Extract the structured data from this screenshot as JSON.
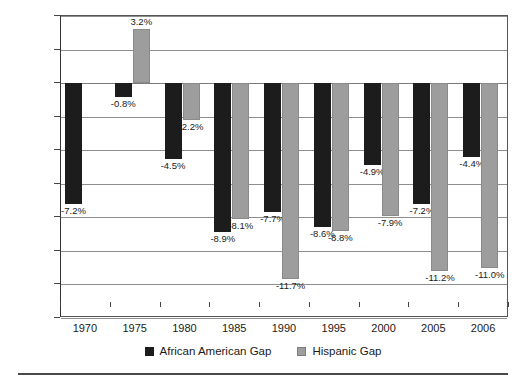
{
  "chart_data": {
    "type": "bar",
    "title": "",
    "subtitle": "",
    "xlabel": "",
    "ylabel": "",
    "categories": [
      "1970",
      "1975",
      "1980",
      "1985",
      "1990",
      "1995",
      "2000",
      "2005",
      "2006"
    ],
    "series": [
      {
        "name": "African American Gap",
        "color": "#1c1c1c",
        "values": [
          -7.2,
          -0.8,
          -4.5,
          -8.9,
          -7.7,
          -8.6,
          -4.9,
          -7.2,
          -4.4
        ],
        "labels": [
          "-7.2%",
          "-0.8%",
          "-4.5%",
          "-8.9%",
          "-7.7%",
          "-8.6%",
          "-4.9%",
          "-7.2%",
          "-4.4%"
        ]
      },
      {
        "name": "Hispanic Gap",
        "color": "#9d9d9d",
        "values": [
          null,
          3.2,
          -2.2,
          -8.1,
          -11.7,
          -8.8,
          -7.9,
          -11.2,
          -11.0
        ],
        "labels": [
          null,
          "3.2%",
          "-2.2%",
          "-8.1%",
          "-11.7%",
          "-8.8%",
          "-7.9%",
          "-11.2%",
          "-11.0%"
        ]
      }
    ],
    "ylim": [
      -14.0,
      4.0
    ],
    "ytick_values": [
      4.0,
      2.0,
      0.0,
      -2.0,
      -4.0,
      -6.0,
      -8.0,
      -10.0,
      -12.0,
      -14.0
    ],
    "ytick_labels": [
      "4.0%",
      "2.0%",
      "0.0%",
      "-2.0%",
      "-4.0%",
      "-6.0%",
      "-8.0%",
      "-10.0%",
      "-12.0%",
      "-14.0%"
    ],
    "grid": true,
    "legend_position": "bottom"
  },
  "legend": {
    "items": [
      {
        "label": "African American Gap",
        "swatch": "black"
      },
      {
        "label": "Hispanic Gap",
        "swatch": "gray"
      }
    ]
  }
}
